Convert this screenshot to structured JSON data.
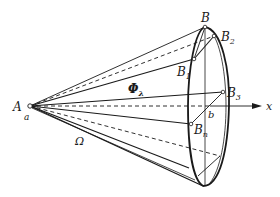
{
  "figure": {
    "type": "cone-projection-diagram",
    "background": "#ffffff",
    "ink": "#1a1a1a"
  },
  "labels": {
    "A": "A",
    "a": "a",
    "B": "B",
    "B1_main": "B",
    "B1_sub": "1",
    "B2_main": "B",
    "B2_sub": "2",
    "B3_main": "B",
    "B3_sub": "3",
    "Bn_main": "B",
    "Bn_sub": "n",
    "b": "b",
    "x": "x",
    "Phi_main": "Φ",
    "Phi_sub": "λ",
    "Omega": "Ω"
  },
  "points": {
    "A": [
      30,
      106
    ],
    "B": [
      205,
      27
    ],
    "B1": [
      194,
      59
    ],
    "B2": [
      214,
      36
    ],
    "B3": [
      223,
      92
    ],
    "Bn": [
      191,
      124
    ],
    "b": [
      210,
      106
    ],
    "bottom": [
      203,
      186
    ]
  }
}
